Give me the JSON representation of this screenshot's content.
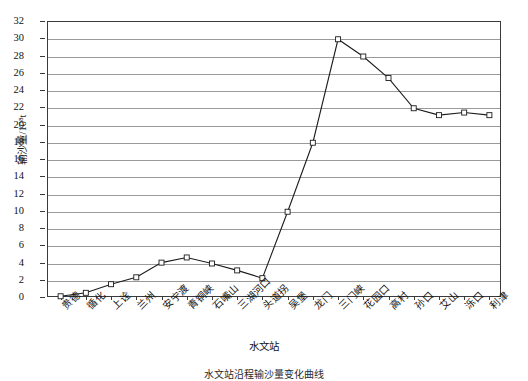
{
  "chart_data": {
    "type": "line",
    "title": "",
    "xlabel": "水文站",
    "ylabel": "输沙量/10⁸t",
    "ylim": [
      0,
      32
    ],
    "ytick_step": 2,
    "grid": true,
    "legend": "none",
    "marker": "open-square",
    "line_color": "#1c1c1c",
    "grid_color": "#9a9a9a",
    "categories": [
      "贵德",
      "循化",
      "上诠",
      "兰州",
      "安宁渡",
      "青铜峡",
      "石嘴山",
      "三湖河口",
      "头道拐",
      "吴堡",
      "龙门",
      "三门峡",
      "花园口",
      "高村",
      "孙口",
      "艾山",
      "泺口",
      "利津"
    ],
    "values": [
      0.2,
      0.6,
      1.6,
      2.4,
      4.1,
      4.7,
      4.0,
      3.2,
      2.3,
      10.0,
      18.0,
      30.0,
      28.0,
      25.5,
      22.0,
      21.2,
      21.5,
      21.2
    ],
    "ytick_labels": [
      "0",
      "2",
      "4",
      "6",
      "8",
      "10",
      "12",
      "14",
      "16",
      "18",
      "20",
      "22",
      "24",
      "26",
      "28",
      "30",
      "32"
    ],
    "caption": "水文站沿程输沙量变化曲线"
  }
}
